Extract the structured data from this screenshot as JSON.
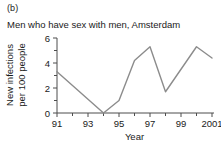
{
  "panel": {
    "label": "(b)"
  },
  "chart_data": {
    "type": "line",
    "title": "Men who have sex with men, Amsterdam",
    "xlabel": "Year",
    "ylabel_line1": "New infections",
    "ylabel_line2": "per 100 people",
    "ylabel": "New infections per 100 people",
    "xlim": [
      1991,
      2001
    ],
    "ylim": [
      0,
      6
    ],
    "yticks": [
      0,
      2,
      4,
      6
    ],
    "ytick_labels": [
      "0",
      "2",
      "4",
      "6"
    ],
    "xticks": [
      1991,
      1993,
      1995,
      1997,
      1999,
      2001
    ],
    "xtick_labels": [
      "91",
      "93",
      "95",
      "97",
      "99",
      "2001"
    ],
    "grid": false,
    "legend": false,
    "series": [
      {
        "name": "New infections per 100 people",
        "color": "#8c8c8c",
        "x": [
          1991,
          1994,
          1995,
          1996,
          1997,
          1998,
          2000,
          2001
        ],
        "values": [
          3.3,
          0.0,
          1.0,
          4.2,
          5.3,
          1.7,
          5.3,
          4.4
        ]
      }
    ]
  }
}
